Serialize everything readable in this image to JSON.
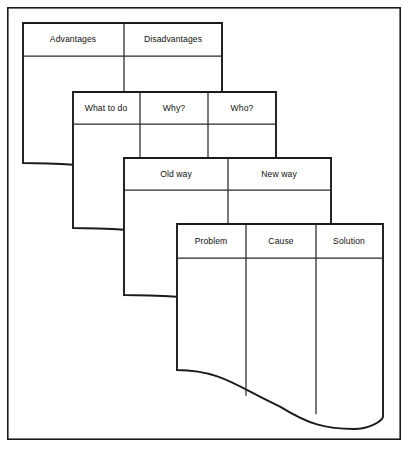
{
  "diagram": {
    "canvas": {
      "width": 411,
      "height": 452
    },
    "frame": {
      "x": 7,
      "y": 7,
      "width": 394,
      "height": 433,
      "stroke": "#1b1b1b"
    },
    "ink_color": "#1b1b1b",
    "paper_color": "#ffffff",
    "cards": [
      {
        "id": "card-advantages",
        "order": 1,
        "x": 23,
        "y": 23,
        "right": 222,
        "header_bottom": 56,
        "wave_top": 163,
        "wave_bottom": 172,
        "wave_style": "single-dip",
        "columns": [
          {
            "label": "Advantages",
            "center_x": 73
          },
          {
            "label": "Disadvantages",
            "center_x": 173
          }
        ],
        "dividers": [
          124
        ]
      },
      {
        "id": "card-what-to-do",
        "order": 2,
        "x": 73,
        "y": 92,
        "right": 276,
        "header_bottom": 124,
        "wave_top": 228,
        "wave_bottom": 237,
        "wave_style": "single-dip",
        "columns": [
          {
            "label": "What to do",
            "center_x": 106
          },
          {
            "label": "Why?",
            "center_x": 174
          },
          {
            "label": "Who?",
            "center_x": 242
          }
        ],
        "dividers": [
          140,
          208
        ]
      },
      {
        "id": "card-old-way",
        "order": 3,
        "x": 124,
        "y": 158,
        "right": 331,
        "header_bottom": 190,
        "wave_top": 295,
        "wave_bottom": 304,
        "wave_style": "single-dip",
        "columns": [
          {
            "label": "Old way",
            "center_x": 176
          },
          {
            "label": "New way",
            "center_x": 279
          }
        ],
        "dividers": [
          228
        ]
      },
      {
        "id": "card-problem",
        "order": 4,
        "x": 177,
        "y": 224,
        "right": 383,
        "header_bottom": 258,
        "wave_top": 370,
        "wave_bottom": 429,
        "wave_style": "s-curve-deep",
        "columns": [
          {
            "label": "Problem",
            "center_x": 211
          },
          {
            "label": "Cause",
            "center_x": 281
          },
          {
            "label": "Solution",
            "center_x": 349
          }
        ],
        "dividers": [
          246,
          316
        ]
      }
    ]
  }
}
